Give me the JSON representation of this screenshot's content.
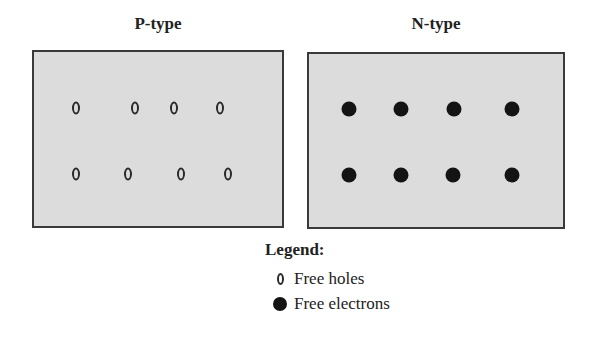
{
  "panels": [
    {
      "title": "P-type",
      "carrier": "hole",
      "box": {
        "left": 32,
        "top": 50,
        "width": 252,
        "height": 178
      },
      "carriers": [
        {
          "x": 42,
          "y": 56
        },
        {
          "x": 101,
          "y": 56
        },
        {
          "x": 140,
          "y": 56
        },
        {
          "x": 186,
          "y": 56
        },
        {
          "x": 42,
          "y": 122
        },
        {
          "x": 94,
          "y": 122
        },
        {
          "x": 147,
          "y": 122
        },
        {
          "x": 194,
          "y": 122
        }
      ]
    },
    {
      "title": "N-type",
      "carrier": "electron",
      "box": {
        "left": 307,
        "top": 52,
        "width": 258,
        "height": 177
      },
      "carriers": [
        {
          "x": 40,
          "y": 55
        },
        {
          "x": 92,
          "y": 55
        },
        {
          "x": 145,
          "y": 55
        },
        {
          "x": 203,
          "y": 55
        },
        {
          "x": 40,
          "y": 121
        },
        {
          "x": 92,
          "y": 121
        },
        {
          "x": 144,
          "y": 121
        },
        {
          "x": 203,
          "y": 121
        }
      ]
    }
  ],
  "legend": {
    "title": "Legend:",
    "items": [
      {
        "symbol": "hole",
        "label": "Free holes"
      },
      {
        "symbol": "electron",
        "label": "Free electrons"
      }
    ]
  },
  "colors": {
    "panel_fill": "#dcdcdc",
    "panel_border": "#3a3a3a",
    "carrier": "#141414"
  }
}
